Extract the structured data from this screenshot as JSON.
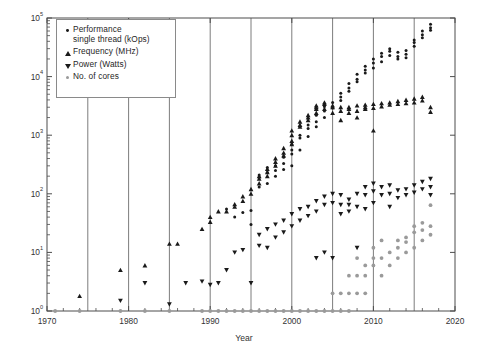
{
  "chart_data": {
    "type": "scatter",
    "title": "",
    "xlabel": "Year",
    "ylabel": "",
    "xlim": [
      1970,
      2020
    ],
    "ylim": [
      1,
      100000
    ],
    "yscale": "log",
    "grid": "vertical-only",
    "xticks": [
      1970,
      1980,
      1990,
      2000,
      2010,
      2020
    ],
    "xtick_labels": [
      "1970",
      "1980",
      "1990",
      "2000",
      "2010",
      "2020"
    ],
    "vertical_gridlines": [
      1975,
      1980,
      1985,
      1990,
      1995,
      2000,
      2005,
      2010,
      2015
    ],
    "yticks": [
      1,
      10,
      100,
      1000,
      10000,
      100000
    ],
    "ytick_labels": [
      "10^0",
      "10^1",
      "10^2",
      "10^3",
      "10^4",
      "10^5"
    ],
    "ytick_mantissa": [
      "10",
      "10",
      "10",
      "10",
      "10",
      "10"
    ],
    "ytick_exponent": [
      "0",
      "1",
      "2",
      "3",
      "4",
      "5"
    ],
    "legend_position": "upper-left-inside",
    "colors": {
      "performance": "#1a1a1a",
      "frequency": "#1a1a1a",
      "power": "#1a1a1a",
      "cores": "#9a9a9a",
      "axis": "#4d4d4d",
      "gridline": "#6e6e6e",
      "text": "#333333"
    },
    "series": [
      {
        "name": "Performance single thread (kOps)",
        "legend_label": "Performance\nsingle thread (kOps)",
        "marker": "circle",
        "color": "#1a1a1a",
        "points": [
          [
            1992,
            55
          ],
          [
            1993,
            40
          ],
          [
            1994,
            48
          ],
          [
            1995,
            52
          ],
          [
            1995,
            30
          ],
          [
            1996,
            130
          ],
          [
            1996,
            190
          ],
          [
            1996,
            210
          ],
          [
            1997,
            150
          ],
          [
            1997,
            230
          ],
          [
            1997,
            280
          ],
          [
            1998,
            250
          ],
          [
            1998,
            300
          ],
          [
            1998,
            200
          ],
          [
            1999,
            330
          ],
          [
            1999,
            420
          ],
          [
            1999,
            260
          ],
          [
            2000,
            480
          ],
          [
            2000,
            560
          ],
          [
            2000,
            300
          ],
          [
            2000,
            700
          ],
          [
            2001,
            560
          ],
          [
            2001,
            900
          ],
          [
            2001,
            1000
          ],
          [
            2002,
            1300
          ],
          [
            2002,
            1500
          ],
          [
            2002,
            950
          ],
          [
            2003,
            1700
          ],
          [
            2003,
            2200
          ],
          [
            2003,
            1400
          ],
          [
            2004,
            2600
          ],
          [
            2004,
            3100
          ],
          [
            2004,
            2000
          ],
          [
            2005,
            2900
          ],
          [
            2005,
            3600
          ],
          [
            2006,
            4500
          ],
          [
            2006,
            5200
          ],
          [
            2006,
            3900
          ],
          [
            2007,
            6400
          ],
          [
            2007,
            7600
          ],
          [
            2007,
            5600
          ],
          [
            2008,
            9000
          ],
          [
            2008,
            11000
          ],
          [
            2008,
            8200
          ],
          [
            2009,
            13000
          ],
          [
            2009,
            15000
          ],
          [
            2009,
            11500
          ],
          [
            2010,
            17000
          ],
          [
            2010,
            14000
          ],
          [
            2010,
            20000
          ],
          [
            2011,
            22000
          ],
          [
            2011,
            18000
          ],
          [
            2011,
            25000
          ],
          [
            2012,
            27000
          ],
          [
            2012,
            23000
          ],
          [
            2012,
            30000
          ],
          [
            2013,
            26000
          ],
          [
            2013,
            22000
          ],
          [
            2013,
            20000
          ],
          [
            2014,
            24000
          ],
          [
            2014,
            21000
          ],
          [
            2014,
            28000
          ],
          [
            2015,
            33000
          ],
          [
            2015,
            38000
          ],
          [
            2015,
            42000
          ],
          [
            2016,
            46000
          ],
          [
            2016,
            52000
          ],
          [
            2016,
            60000
          ],
          [
            2017,
            68000
          ],
          [
            2017,
            78000
          ],
          [
            2017,
            62000
          ]
        ]
      },
      {
        "name": "Frequency (MHz)",
        "legend_label": "Frequency (MHz)",
        "marker": "triangle-up",
        "color": "#1a1a1a",
        "points": [
          [
            1974,
            1.8
          ],
          [
            1979,
            5
          ],
          [
            1982,
            6
          ],
          [
            1985,
            14
          ],
          [
            1986,
            14
          ],
          [
            1989,
            25
          ],
          [
            1990,
            33
          ],
          [
            1990,
            40
          ],
          [
            1991,
            50
          ],
          [
            1992,
            50
          ],
          [
            1993,
            60
          ],
          [
            1993,
            66
          ],
          [
            1994,
            75
          ],
          [
            1994,
            90
          ],
          [
            1995,
            100
          ],
          [
            1995,
            120
          ],
          [
            1996,
            150
          ],
          [
            1996,
            180
          ],
          [
            1996,
            200
          ],
          [
            1997,
            200
          ],
          [
            1997,
            233
          ],
          [
            1997,
            266
          ],
          [
            1998,
            300
          ],
          [
            1998,
            350
          ],
          [
            1998,
            400
          ],
          [
            1999,
            450
          ],
          [
            1999,
            500
          ],
          [
            1999,
            600
          ],
          [
            2000,
            700
          ],
          [
            2000,
            800
          ],
          [
            2000,
            1000
          ],
          [
            2000,
            1200
          ],
          [
            2001,
            1400
          ],
          [
            2001,
            1500
          ],
          [
            2001,
            1700
          ],
          [
            2002,
            1800
          ],
          [
            2002,
            2000
          ],
          [
            2002,
            2200
          ],
          [
            2003,
            2400
          ],
          [
            2003,
            2800
          ],
          [
            2003,
            3000
          ],
          [
            2003,
            3200
          ],
          [
            2004,
            3400
          ],
          [
            2004,
            3600
          ],
          [
            2004,
            2800
          ],
          [
            2005,
            3000
          ],
          [
            2005,
            2400
          ],
          [
            2005,
            3200
          ],
          [
            2006,
            2600
          ],
          [
            2006,
            3000
          ],
          [
            2006,
            1800
          ],
          [
            2007,
            2400
          ],
          [
            2007,
            2800
          ],
          [
            2007,
            3000
          ],
          [
            2008,
            2600
          ],
          [
            2008,
            3200
          ],
          [
            2008,
            2000
          ],
          [
            2009,
            2800
          ],
          [
            2009,
            3000
          ],
          [
            2009,
            3300
          ],
          [
            2010,
            2900
          ],
          [
            2010,
            3400
          ],
          [
            2010,
            1200
          ],
          [
            2011,
            3100
          ],
          [
            2011,
            3500
          ],
          [
            2012,
            3300
          ],
          [
            2012,
            3600
          ],
          [
            2013,
            3400
          ],
          [
            2013,
            3800
          ],
          [
            2014,
            3500
          ],
          [
            2014,
            4000
          ],
          [
            2015,
            3600
          ],
          [
            2015,
            4200
          ],
          [
            2016,
            3900
          ],
          [
            2016,
            4500
          ],
          [
            2017,
            3000
          ],
          [
            2017,
            2500
          ]
        ]
      },
      {
        "name": "Power (Watts)",
        "legend_label": "Power (Watts)",
        "marker": "triangle-down",
        "color": "#1a1a1a",
        "points": [
          [
            1979,
            1.5
          ],
          [
            1982,
            3
          ],
          [
            1985,
            1.3
          ],
          [
            1987,
            3
          ],
          [
            1989,
            3.2
          ],
          [
            1990,
            2.8
          ],
          [
            1991,
            3
          ],
          [
            1992,
            5
          ],
          [
            1993,
            10
          ],
          [
            1994,
            11
          ],
          [
            1995,
            3
          ],
          [
            1996,
            13
          ],
          [
            1996,
            20
          ],
          [
            1997,
            25
          ],
          [
            1997,
            12
          ],
          [
            1998,
            18
          ],
          [
            1998,
            30
          ],
          [
            1999,
            22
          ],
          [
            1999,
            35
          ],
          [
            2000,
            28
          ],
          [
            2000,
            45
          ],
          [
            2001,
            55
          ],
          [
            2001,
            35
          ],
          [
            2002,
            60
          ],
          [
            2002,
            42
          ],
          [
            2003,
            75
          ],
          [
            2003,
            50
          ],
          [
            2003,
            8
          ],
          [
            2004,
            90
          ],
          [
            2004,
            65
          ],
          [
            2004,
            10
          ],
          [
            2005,
            100
          ],
          [
            2005,
            70
          ],
          [
            2005,
            8
          ],
          [
            2006,
            65
          ],
          [
            2006,
            95
          ],
          [
            2006,
            45
          ],
          [
            2007,
            80
          ],
          [
            2007,
            50
          ],
          [
            2007,
            65
          ],
          [
            2008,
            100
          ],
          [
            2008,
            60
          ],
          [
            2008,
            12
          ],
          [
            2009,
            95
          ],
          [
            2009,
            55
          ],
          [
            2009,
            130
          ],
          [
            2010,
            110
          ],
          [
            2010,
            70
          ],
          [
            2010,
            150
          ],
          [
            2011,
            95
          ],
          [
            2011,
            130
          ],
          [
            2012,
            100
          ],
          [
            2012,
            140
          ],
          [
            2012,
            60
          ],
          [
            2013,
            115
          ],
          [
            2013,
            85
          ],
          [
            2014,
            120
          ],
          [
            2014,
            95
          ],
          [
            2015,
            140
          ],
          [
            2015,
            105
          ],
          [
            2016,
            160
          ],
          [
            2016,
            120
          ],
          [
            2017,
            180
          ],
          [
            2017,
            95
          ],
          [
            2017,
            130
          ]
        ]
      },
      {
        "name": "No. of cores",
        "legend_label": "No. of cores",
        "marker": "circle",
        "color": "#9a9a9a",
        "points": [
          [
            1971,
            1
          ],
          [
            1974,
            1
          ],
          [
            1979,
            1
          ],
          [
            1982,
            1
          ],
          [
            1985,
            1
          ],
          [
            1989,
            1
          ],
          [
            1990,
            1
          ],
          [
            1991,
            1
          ],
          [
            1992,
            1
          ],
          [
            1993,
            1
          ],
          [
            1994,
            1
          ],
          [
            1995,
            1
          ],
          [
            1996,
            1
          ],
          [
            1997,
            1
          ],
          [
            1998,
            1
          ],
          [
            1999,
            1
          ],
          [
            2000,
            1
          ],
          [
            2001,
            1
          ],
          [
            2002,
            1
          ],
          [
            2003,
            1
          ],
          [
            2004,
            1
          ],
          [
            2005,
            1
          ],
          [
            2005,
            2
          ],
          [
            2006,
            2
          ],
          [
            2006,
            1
          ],
          [
            2007,
            2
          ],
          [
            2007,
            4
          ],
          [
            2007,
            1
          ],
          [
            2008,
            2
          ],
          [
            2008,
            4
          ],
          [
            2008,
            8
          ],
          [
            2009,
            4
          ],
          [
            2009,
            6
          ],
          [
            2009,
            2
          ],
          [
            2010,
            6
          ],
          [
            2010,
            8
          ],
          [
            2010,
            12
          ],
          [
            2011,
            8
          ],
          [
            2011,
            4
          ],
          [
            2011,
            16
          ],
          [
            2012,
            10
          ],
          [
            2012,
            6
          ],
          [
            2013,
            12
          ],
          [
            2013,
            8
          ],
          [
            2013,
            16
          ],
          [
            2014,
            15
          ],
          [
            2014,
            10
          ],
          [
            2014,
            18
          ],
          [
            2015,
            22
          ],
          [
            2015,
            12
          ],
          [
            2015,
            28
          ],
          [
            2016,
            24
          ],
          [
            2016,
            16
          ],
          [
            2016,
            32
          ],
          [
            2017,
            28
          ],
          [
            2017,
            20
          ],
          [
            2017,
            64
          ]
        ]
      }
    ]
  },
  "legend": {
    "items": [
      {
        "label": "Performance\nsingle thread (kOps)",
        "marker": "circle-black"
      },
      {
        "label": "Frequency (MHz)",
        "marker": "triangle-up-black"
      },
      {
        "label": "Power (Watts)",
        "marker": "triangle-down-black"
      },
      {
        "label": "No. of cores",
        "marker": "circle-gray"
      }
    ]
  },
  "axes": {
    "xlabel": "Year"
  }
}
